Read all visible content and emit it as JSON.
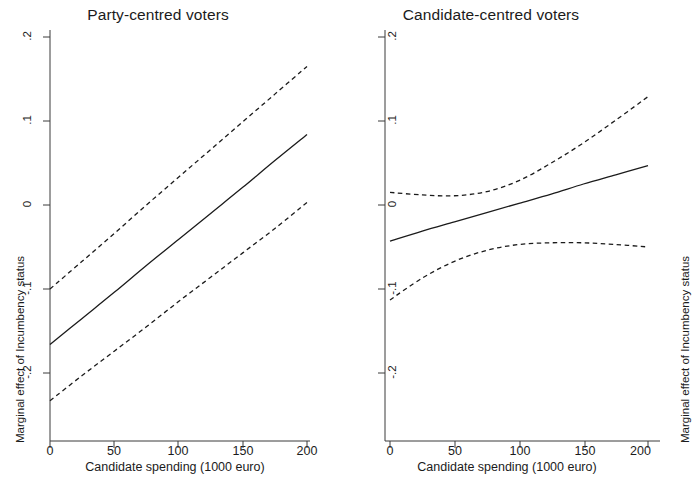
{
  "figure": {
    "background": "#ffffff",
    "line_color": "#1b1b1b",
    "axis_color": "#3a3a3a"
  },
  "panels": [
    {
      "id": "party-centred",
      "title": "Party-centred voters",
      "xlabel": "Candidate spending (1000 euro)",
      "ylabel": "Marginal effect of Incumbency status"
    },
    {
      "id": "candidate-centred",
      "title": "Candidate-centred voters",
      "xlabel": "Candidate spending (1000 euro)",
      "ylabel": "Marginal effect of Incumbency status"
    }
  ],
  "axes": {
    "xticks": [
      "0",
      "50",
      "100",
      "150",
      "200"
    ],
    "yticks": [
      ".2",
      ".1",
      "0",
      "-.1",
      "-.2"
    ]
  },
  "chart_data": [
    {
      "type": "line",
      "title": "Party-centred voters",
      "xlabel": "Candidate spending (1000 euro)",
      "ylabel": "Marginal effect of Incumbency status",
      "xlim": [
        0,
        200
      ],
      "ylim": [
        -0.24,
        0.22
      ],
      "xticks": [
        0,
        50,
        100,
        150,
        200
      ],
      "yticks": [
        0.2,
        0.1,
        0,
        -0.1,
        -0.2
      ],
      "grid": false,
      "legend": "none",
      "x": [
        0,
        25,
        50,
        75,
        100,
        125,
        150,
        175,
        200
      ],
      "series": [
        {
          "name": "Marginal effect (point estimate)",
          "style": "solid",
          "values": [
            -0.166,
            -0.135,
            -0.104,
            -0.072,
            -0.041,
            -0.01,
            0.021,
            0.053,
            0.084
          ]
        },
        {
          "name": "Upper 95% confidence bound",
          "style": "dashed",
          "values": [
            -0.1,
            -0.067,
            -0.034,
            0.0,
            0.033,
            0.066,
            0.099,
            0.132,
            0.165
          ]
        },
        {
          "name": "Lower 95% confidence bound",
          "style": "dashed",
          "values": [
            -0.233,
            -0.203,
            -0.174,
            -0.145,
            -0.115,
            -0.086,
            -0.057,
            -0.028,
            0.003
          ]
        }
      ]
    },
    {
      "type": "line",
      "title": "Candidate-centred voters",
      "xlabel": "Candidate spending (1000 euro)",
      "ylabel": "Marginal effect of Incumbency status",
      "xlim": [
        0,
        200
      ],
      "ylim": [
        -0.24,
        0.22
      ],
      "xticks": [
        0,
        50,
        100,
        150,
        200
      ],
      "yticks": [
        0.2,
        0.1,
        0,
        -0.1,
        -0.2
      ],
      "grid": false,
      "legend": "none",
      "x": [
        0,
        25,
        50,
        75,
        100,
        125,
        150,
        175,
        200
      ],
      "series": [
        {
          "name": "Marginal effect (point estimate)",
          "style": "solid",
          "values": [
            -0.043,
            -0.031,
            -0.02,
            -0.009,
            0.002,
            0.013,
            0.025,
            0.036,
            0.047
          ]
        },
        {
          "name": "Upper 95% confidence bound",
          "style": "dashed",
          "values": [
            0.015,
            0.012,
            0.011,
            0.016,
            0.029,
            0.05,
            0.074,
            0.101,
            0.129
          ]
        },
        {
          "name": "Lower 95% confidence bound",
          "style": "dashed",
          "values": [
            -0.113,
            -0.087,
            -0.067,
            -0.054,
            -0.047,
            -0.045,
            -0.045,
            -0.047,
            -0.05
          ]
        }
      ]
    }
  ]
}
